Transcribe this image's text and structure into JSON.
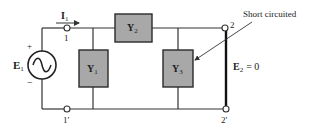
{
  "diagram": {
    "colors": {
      "wire": "#333333",
      "box_fill": "#a8a8a8",
      "box_stroke": "#2a2a2a",
      "text": "#222222"
    },
    "source": {
      "label": "E",
      "subscript": "1",
      "plus": "+",
      "minus": "−",
      "icon": "ac-source-icon"
    },
    "current": {
      "label": "I",
      "subscript": "1"
    },
    "terminals": {
      "t1": "1",
      "t1p": "1′",
      "t2": "2",
      "t2p": "2′"
    },
    "admittances": [
      {
        "label": "Y",
        "subscript": "1"
      },
      {
        "label": "Y",
        "subscript": "2"
      },
      {
        "label": "Y",
        "subscript": "3"
      }
    ],
    "annotation": {
      "text": "Short circuited"
    },
    "output_voltage": {
      "label": "E",
      "subscript": "2",
      "equals": "= 0"
    }
  }
}
